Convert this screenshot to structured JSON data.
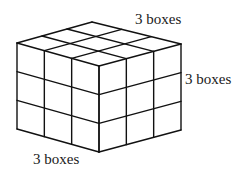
{
  "diagram": {
    "type": "isometric-cube-grid",
    "divisions": {
      "width": 3,
      "depth": 3,
      "height": 3
    },
    "vertices": {
      "top_back": [
        92,
        22
      ],
      "top_left": [
        17,
        43
      ],
      "top_front": [
        99,
        66
      ],
      "top_right": [
        181,
        44
      ],
      "height": 86
    },
    "colors": {
      "stroke": "#111111",
      "background": "#ffffff",
      "text": "#1a1a1a"
    },
    "labels": {
      "top": {
        "text": "3 boxes",
        "x": 135,
        "y": 24
      },
      "right": {
        "text": "3 boxes",
        "x": 185,
        "y": 84
      },
      "bottom": {
        "text": "3 boxes",
        "x": 33,
        "y": 164
      }
    }
  }
}
